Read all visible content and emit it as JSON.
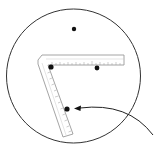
{
  "diagram": {
    "colors": {
      "stroke": "#333333",
      "dot": "#111111",
      "ruler_fill": "#ffffff",
      "ruler_edge": "#9a9a9a",
      "tick": "#999999"
    },
    "circle": {
      "cx": 73.5,
      "cy": 76,
      "r": 67
    },
    "points": [
      {
        "name": "top-point",
        "x": 74,
        "y": 29
      },
      {
        "name": "corner-point",
        "x": 51,
        "y": 67
      },
      {
        "name": "arm-point",
        "x": 97,
        "y": 68
      },
      {
        "name": "indicated-point",
        "x": 67,
        "y": 109
      }
    ],
    "arrow": {
      "from": [
        153,
        135
      ],
      "to": [
        74,
        108
      ]
    }
  }
}
